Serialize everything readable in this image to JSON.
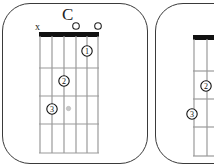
{
  "diagrams": [
    {
      "chord_name": "C",
      "string_markers": [
        "x",
        "",
        "",
        "",
        "o",
        "o"
      ],
      "fingers": [
        {
          "label": "1",
          "string": 5,
          "fret": 1
        },
        {
          "label": "2",
          "string": 3,
          "fret": 2
        },
        {
          "label": "3",
          "string": 2,
          "fret": 3
        }
      ],
      "extra_dot": {
        "string": 3.3,
        "fret": 3
      },
      "frets_shown": 4,
      "strings": 6
    },
    {
      "chord_name": "",
      "fingers": [
        {
          "label": "2",
          "string": 2,
          "fret": 2
        },
        {
          "label": "3",
          "string": 1,
          "fret": 3
        }
      ],
      "frets_shown": 4,
      "strings": 6,
      "partially_visible": true
    }
  ],
  "colors": {
    "border": "#3a3a3a",
    "nut": "#111111",
    "grid": "#9a9a9a",
    "dot_gray": "#c8c8c8"
  }
}
